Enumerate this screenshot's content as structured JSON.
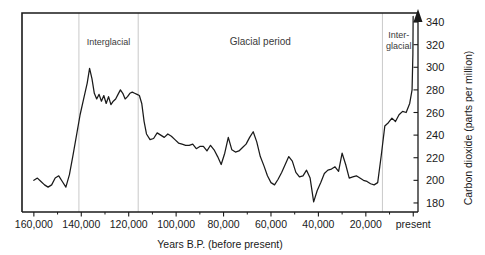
{
  "figure": {
    "title": "",
    "background_color": "#ffffff",
    "line_color": "#1a1a1a",
    "gridline_color": "#c9c9c9"
  },
  "chart_data": {
    "type": "line",
    "title": "",
    "subtitle": "",
    "xlabel": "Years B.P. (before present)",
    "ylabel": "Carbon dioxide (parts per million)",
    "xlim": [
      165000,
      -2000
    ],
    "ylim": [
      172,
      348
    ],
    "x_inverted": true,
    "grid": false,
    "legend_position": "none",
    "x_tick_labels": [
      "160,000",
      "140,000",
      "120,000",
      "100,000",
      "80,000",
      "60,000",
      "40,000",
      "20,000",
      "present"
    ],
    "x_tick_values": [
      160000,
      140000,
      120000,
      100000,
      80000,
      60000,
      40000,
      20000,
      0
    ],
    "x_minor_tick_values": [
      150000,
      130000,
      110000,
      90000,
      70000,
      50000,
      30000,
      10000
    ],
    "y_tick_labels": [
      "180",
      "200",
      "220",
      "240",
      "260",
      "280",
      "300",
      "320",
      "340"
    ],
    "y_tick_values": [
      180,
      200,
      220,
      240,
      260,
      280,
      300,
      320,
      340
    ],
    "series": [
      {
        "name": "Carbon dioxide",
        "x": [
          160000,
          158500,
          157000,
          155500,
          154000,
          152500,
          151000,
          149500,
          148000,
          146500,
          145000,
          143500,
          142000,
          140500,
          139000,
          137500,
          136500,
          135500,
          134500,
          133500,
          132500,
          131500,
          130500,
          129500,
          128500,
          127500,
          126500,
          125500,
          124500,
          123500,
          122500,
          121500,
          120500,
          119500,
          118500,
          117500,
          116500,
          115500,
          114500,
          113500,
          112500,
          111000,
          109500,
          108000,
          106500,
          105000,
          103500,
          102000,
          100500,
          99000,
          97500,
          96000,
          94500,
          93000,
          91500,
          90000,
          88500,
          87000,
          85500,
          84000,
          82500,
          81000,
          79500,
          78000,
          76500,
          75000,
          73500,
          72000,
          70500,
          69000,
          67500,
          66000,
          64500,
          63000,
          61500,
          60000,
          58500,
          57000,
          55500,
          54000,
          52500,
          51000,
          49500,
          48000,
          46500,
          45000,
          43500,
          42000,
          40500,
          39000,
          37500,
          36000,
          34500,
          33000,
          31500,
          30000,
          28500,
          27000,
          25500,
          24000,
          22500,
          21000,
          19500,
          18000,
          16500,
          15000,
          13500,
          12000,
          10500,
          9000,
          7500,
          6000,
          4500,
          3000,
          1500,
          500,
          150,
          50
        ],
        "y": [
          200,
          202,
          199,
          196,
          194,
          196,
          202,
          204,
          199,
          194,
          205,
          222,
          240,
          258,
          272,
          286,
          299,
          290,
          277,
          272,
          276,
          270,
          275,
          268,
          274,
          267,
          270,
          272,
          276,
          280,
          277,
          272,
          274,
          277,
          278,
          277,
          276,
          275,
          268,
          252,
          241,
          236,
          237,
          242,
          240,
          238,
          241,
          239,
          236,
          233,
          232,
          231,
          231,
          232,
          228,
          230,
          230,
          226,
          231,
          227,
          221,
          214,
          224,
          238,
          227,
          225,
          226,
          229,
          232,
          238,
          243,
          234,
          221,
          213,
          204,
          198,
          196,
          201,
          207,
          214,
          221,
          217,
          207,
          203,
          204,
          209,
          202,
          181,
          191,
          198,
          206,
          209,
          210,
          212,
          208,
          224,
          214,
          202,
          203,
          204,
          202,
          200,
          199,
          197,
          196,
          198,
          222,
          248,
          251,
          255,
          252,
          258,
          261,
          260,
          268,
          280,
          312,
          345
        ]
      }
    ],
    "annotations": [
      {
        "id": "interglacial-left",
        "label": "Interglacial",
        "x_start": 141000,
        "x_end": 116000
      },
      {
        "id": "glacial-period",
        "label": "Glacial period",
        "x_start": 116000,
        "x_end": 13000
      },
      {
        "id": "interglacial-right",
        "label_line1": "Inter-",
        "label_line2": "glacial",
        "x_start": 13000,
        "x_end": 0
      }
    ],
    "vertical_dividers": [
      141000,
      116000,
      13000
    ]
  }
}
